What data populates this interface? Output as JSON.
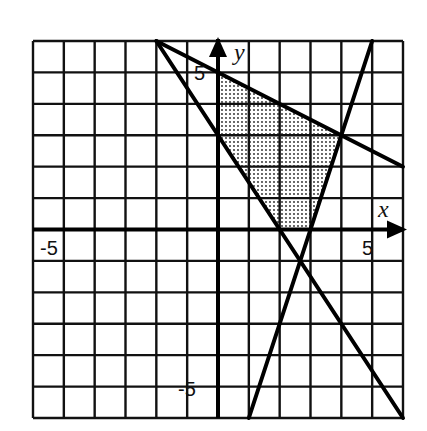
{
  "chart_data": {
    "type": "line",
    "title": "",
    "xlabel": "x",
    "ylabel": "y",
    "xlim": [
      -6,
      6
    ],
    "ylim": [
      -6,
      6
    ],
    "grid": true,
    "tick_labels": {
      "x": [
        "-5",
        "5"
      ],
      "y": [
        "5",
        "-5"
      ]
    },
    "series": [
      {
        "name": "y = -1.5x + 3",
        "points": [
          [
            -2,
            6
          ],
          [
            6,
            -6
          ]
        ]
      },
      {
        "name": "y = -0.5x + 5",
        "points": [
          [
            -2,
            6
          ],
          [
            6,
            2
          ]
        ]
      },
      {
        "name": "y = 3x - 9",
        "points": [
          [
            1,
            -6
          ],
          [
            5,
            6
          ]
        ]
      }
    ],
    "shaded_region": {
      "vertices": [
        [
          0,
          5
        ],
        [
          0,
          3
        ],
        [
          2,
          0
        ],
        [
          3,
          0
        ],
        [
          4,
          3
        ]
      ],
      "pattern": "dots"
    }
  },
  "labels": {
    "x_axis": "x",
    "y_axis": "y",
    "x_neg": "-5",
    "x_pos": "5",
    "y_pos": "5",
    "y_neg": "-5"
  }
}
